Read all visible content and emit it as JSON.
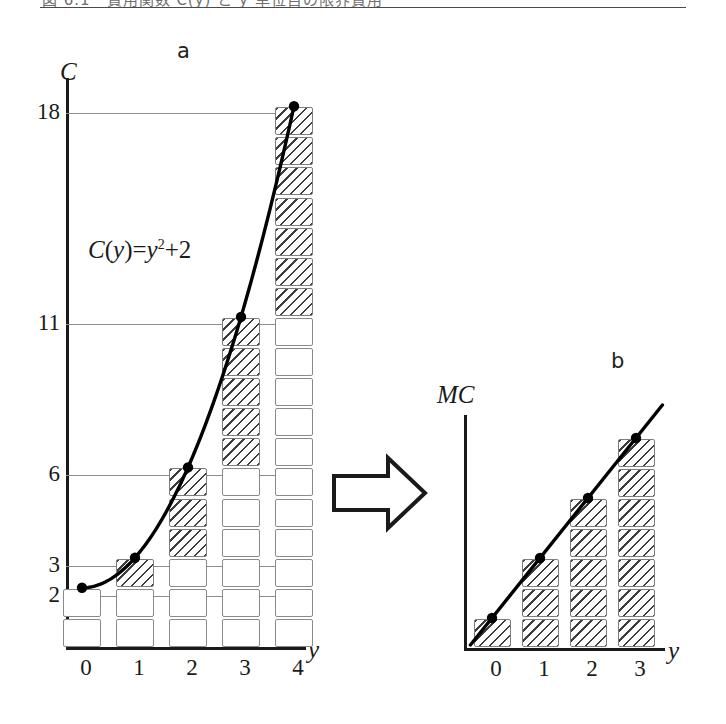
{
  "caption": {
    "text": "図 6.1　費用関数 C(y) と y 単位目の限界費用",
    "rule_visible": true
  },
  "panels": {
    "a": {
      "letter": "a"
    },
    "b": {
      "letter": "b"
    }
  },
  "formula": {
    "lhs_fn": "C",
    "lhs_open": "(",
    "lhs_var": "y",
    "lhs_close": ")",
    "equals": "=",
    "rhs_var": "y",
    "rhs_exp": "2",
    "rhs_plus": "+2",
    "full": "C(y)=y2+2"
  },
  "colors": {
    "axis": "#1a1a1a",
    "gridline": "#8d8d8d",
    "cell_border": "#8a8a8a",
    "hatch": "#3c3c3c",
    "curve": "#000000",
    "point": "#000000"
  },
  "chart_data": [
    {
      "type": "bar",
      "panel": "a",
      "title": "a",
      "annotation": "C(y)=y²+2",
      "xlabel": "y",
      "ylabel": "C",
      "x": [
        0,
        1,
        2,
        3,
        4
      ],
      "categories": [
        "0",
        "1",
        "2",
        "3",
        "4"
      ],
      "xtick_labels": [
        "0",
        "1",
        "2",
        "3",
        "4"
      ],
      "ytick_labels": [
        "2",
        "3",
        "6",
        "11",
        "18"
      ],
      "ytick_values": [
        2,
        3,
        6,
        11,
        18
      ],
      "ylim": [
        0,
        19
      ],
      "xlim": [
        -0.6,
        4.9
      ],
      "grid": true,
      "gridline_values": [
        2,
        3,
        6,
        11,
        18
      ],
      "values": [
        2,
        3,
        6,
        11,
        18
      ],
      "series": [
        {
          "name": "total cost C(y)",
          "values": [
            2,
            3,
            6,
            11,
            18
          ]
        },
        {
          "name": "fixed cost (unhatched squares)",
          "values": [
            2,
            2,
            3,
            6,
            11
          ]
        },
        {
          "name": "marginal blocks (hatched squares)",
          "values": [
            0,
            1,
            3,
            5,
            7
          ]
        }
      ],
      "curve": {
        "label": "C(y)=y²+2",
        "points": [
          {
            "x": 0,
            "y": 2
          },
          {
            "x": 1,
            "y": 3
          },
          {
            "x": 2,
            "y": 6
          },
          {
            "x": 3,
            "y": 11
          },
          {
            "x": 4,
            "y": 18
          }
        ],
        "marker": "filled-circle"
      }
    },
    {
      "type": "bar",
      "panel": "b",
      "title": "b",
      "xlabel": "y",
      "ylabel": "MC",
      "x": [
        0,
        1,
        2,
        3
      ],
      "categories": [
        "0",
        "1",
        "2",
        "3"
      ],
      "xtick_labels": [
        "0",
        "1",
        "2",
        "3"
      ],
      "ytick_labels": [],
      "ylim": [
        0,
        8
      ],
      "xlim": [
        -0.6,
        4.2
      ],
      "grid": false,
      "values": [
        1,
        3,
        5,
        7
      ],
      "series": [
        {
          "name": "marginal cost MC(y)",
          "values": [
            1,
            3,
            5,
            7
          ]
        }
      ],
      "curve": {
        "label": "MC",
        "points": [
          {
            "x": 0,
            "y": 1
          },
          {
            "x": 1,
            "y": 3
          },
          {
            "x": 2,
            "y": 5
          },
          {
            "x": 3,
            "y": 7
          }
        ],
        "marker": "filled-circle"
      }
    }
  ],
  "arrow": {
    "name": "right-arrow",
    "direction": "right"
  }
}
